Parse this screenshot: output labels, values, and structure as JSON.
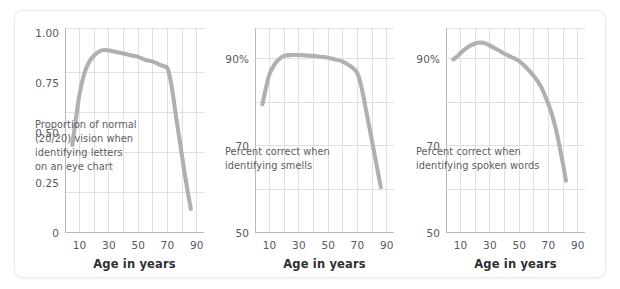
{
  "figure": {
    "background_color": "#ffffff",
    "card_border_color": "#ececed",
    "line_color": "#b0b0b2",
    "grid_color": "#dcdce2",
    "axis_color": "#b9b9bd",
    "text_color": "#58585c"
  },
  "chart_data": [
    {
      "type": "line",
      "id": "vision",
      "title": "",
      "annotation": "Proportion of normal\n(20/20) vision when\nidentifying letters\non an eye chart",
      "xlabel": "Age in years",
      "ylabel": "",
      "xlim": [
        0,
        95
      ],
      "ylim": [
        0,
        1.28
      ],
      "grid": true,
      "legend": "none",
      "xticks": [
        10,
        30,
        50,
        70,
        90
      ],
      "xticklabels": [
        "10",
        "30",
        "50",
        "70",
        "90"
      ],
      "xminorticks": [
        20,
        40,
        60,
        80
      ],
      "yticks": [
        0,
        0.25,
        0.5,
        0.75,
        1.0
      ],
      "yticklabels": [
        "0",
        "0.25",
        "0.50",
        "0.75",
        "1.00"
      ],
      "series": [
        {
          "name": "Proportion of normal (20/20) vision",
          "x": [
            5,
            8,
            10,
            13,
            16,
            20,
            25,
            30,
            35,
            40,
            45,
            50,
            55,
            60,
            65,
            68,
            70,
            72,
            74,
            76,
            78,
            80,
            82,
            84,
            86
          ],
          "y": [
            0.55,
            0.75,
            0.87,
            0.99,
            1.06,
            1.11,
            1.14,
            1.14,
            1.13,
            1.12,
            1.11,
            1.1,
            1.08,
            1.07,
            1.05,
            1.04,
            1.03,
            0.96,
            0.85,
            0.72,
            0.6,
            0.48,
            0.36,
            0.25,
            0.15
          ]
        }
      ]
    },
    {
      "type": "line",
      "id": "smell",
      "title": "",
      "annotation": "Percent correct when\nidentifying smells",
      "xlabel": "Age in years",
      "ylabel": "",
      "xlim": [
        0,
        95
      ],
      "ylim": [
        50,
        97
      ],
      "grid": true,
      "legend": "none",
      "xticks": [
        10,
        30,
        50,
        70,
        90
      ],
      "xticklabels": [
        "10",
        "30",
        "50",
        "70",
        "90"
      ],
      "xminorticks": [
        20,
        40,
        60,
        80
      ],
      "yticks": [
        50,
        70,
        90
      ],
      "yticklabels": [
        "50",
        "70",
        "90%"
      ],
      "yminorticks": [
        60,
        80
      ],
      "series": [
        {
          "name": "Percent correct identifying smells",
          "x": [
            5,
            8,
            10,
            13,
            16,
            20,
            25,
            30,
            35,
            40,
            45,
            50,
            55,
            60,
            65,
            68,
            70,
            72,
            74,
            76,
            78,
            80,
            82,
            84,
            86
          ],
          "y": [
            79.5,
            84.0,
            86.5,
            88.5,
            89.7,
            90.6,
            90.8,
            90.8,
            90.7,
            90.6,
            90.4,
            90.2,
            89.8,
            89.3,
            88.3,
            87.5,
            86.6,
            84.5,
            81.5,
            78.0,
            74.5,
            71.0,
            67.5,
            64.0,
            60.5
          ]
        }
      ]
    },
    {
      "type": "line",
      "id": "speech",
      "title": "",
      "annotation": "Percent correct when\nidentifying spoken words",
      "xlabel": "Age in years",
      "ylabel": "",
      "xlim": [
        0,
        95
      ],
      "ylim": [
        50,
        97
      ],
      "grid": true,
      "legend": "none",
      "xticks": [
        10,
        30,
        50,
        70,
        90
      ],
      "xticklabels": [
        "10",
        "30",
        "50",
        "70",
        "90"
      ],
      "xminorticks": [
        20,
        40,
        60,
        80
      ],
      "yticks": [
        50,
        70,
        90
      ],
      "yticklabels": [
        "50",
        "70",
        "90%"
      ],
      "yminorticks": [
        60,
        80
      ],
      "series": [
        {
          "name": "Percent correct identifying spoken words",
          "x": [
            5,
            8,
            10,
            14,
            18,
            22,
            25,
            28,
            32,
            36,
            40,
            45,
            50,
            55,
            60,
            65,
            70,
            73,
            76,
            79,
            82
          ],
          "y": [
            89.8,
            90.6,
            91.3,
            92.4,
            93.2,
            93.6,
            93.6,
            93.3,
            92.6,
            91.9,
            91.1,
            90.3,
            89.4,
            87.9,
            86.0,
            83.5,
            79.5,
            76.5,
            72.5,
            67.5,
            62.0
          ]
        }
      ]
    }
  ],
  "panels": {
    "vision": {
      "annotation": "Proportion of normal\n(20/20) vision when\nidentifying letters\non an eye chart",
      "axis_title": "Age in years",
      "yticklabels": [
        "0",
        "0.25",
        "0.50",
        "0.75",
        "1.00"
      ],
      "xticklabels": [
        "10",
        "30",
        "50",
        "70",
        "90"
      ]
    },
    "smell": {
      "annotation": "Percent correct when\nidentifying smells",
      "axis_title": "Age in years",
      "yticklabels": [
        "50",
        "70",
        "90%"
      ],
      "xticklabels": [
        "10",
        "30",
        "50",
        "70",
        "90"
      ]
    },
    "speech": {
      "annotation": "Percent correct when\nidentifying spoken words",
      "axis_title": "Age in years",
      "yticklabels": [
        "50",
        "70",
        "90%"
      ],
      "xticklabels": [
        "10",
        "30",
        "50",
        "70",
        "90"
      ]
    }
  }
}
